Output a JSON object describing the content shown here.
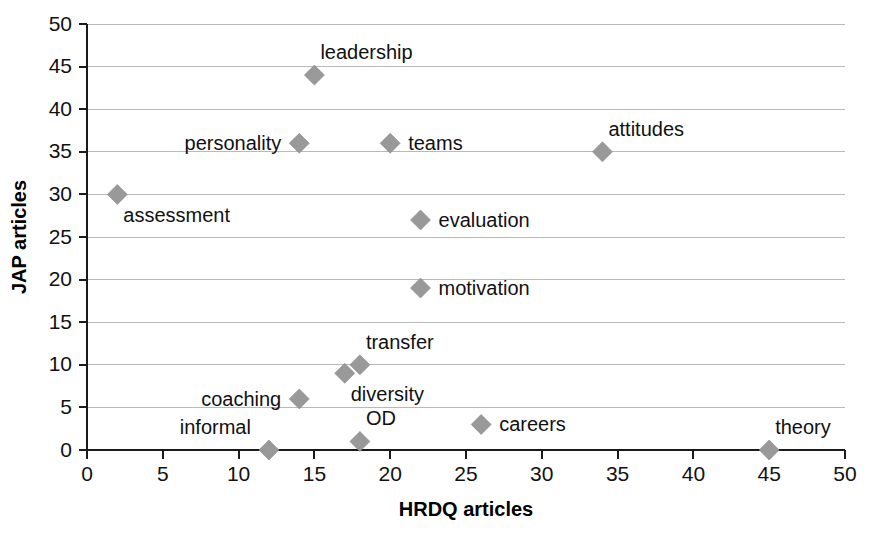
{
  "chart_data": {
    "type": "scatter",
    "title": "",
    "xlabel": "HRDQ articles",
    "ylabel": "JAP articles",
    "xlim": [
      0,
      50
    ],
    "ylim": [
      0,
      50
    ],
    "xticks": [
      0,
      5,
      10,
      15,
      20,
      25,
      30,
      35,
      40,
      45,
      50
    ],
    "yticks": [
      0,
      5,
      10,
      15,
      20,
      25,
      30,
      35,
      40,
      45,
      50
    ],
    "grid": "horizontal",
    "legend": "none",
    "marker": "diamond",
    "marker_color": "#999999",
    "gridline_color": "#b9b9b9",
    "axis_color": "#1a1a1a",
    "background_color": "#ffffff",
    "points": [
      {
        "label": "leadership",
        "x": 15,
        "y": 44,
        "label_pos": "above-right"
      },
      {
        "label": "personality",
        "x": 14,
        "y": 36,
        "label_pos": "left"
      },
      {
        "label": "teams",
        "x": 20,
        "y": 36,
        "label_pos": "right"
      },
      {
        "label": "attitudes",
        "x": 34,
        "y": 35,
        "label_pos": "above-right"
      },
      {
        "label": "assessment",
        "x": 2,
        "y": 30,
        "label_pos": "below-right"
      },
      {
        "label": "evaluation",
        "x": 22,
        "y": 27,
        "label_pos": "right"
      },
      {
        "label": "motivation",
        "x": 22,
        "y": 19,
        "label_pos": "right"
      },
      {
        "label": "transfer",
        "x": 18,
        "y": 10,
        "label_pos": "above-right"
      },
      {
        "label": "diversity",
        "x": 17,
        "y": 9,
        "label_pos": "below-right"
      },
      {
        "label": "coaching",
        "x": 14,
        "y": 6,
        "label_pos": "left"
      },
      {
        "label": "careers",
        "x": 26,
        "y": 3,
        "label_pos": "right"
      },
      {
        "label": "OD",
        "x": 18,
        "y": 1,
        "label_pos": "above-right"
      },
      {
        "label": "informal",
        "x": 12,
        "y": 0,
        "label_pos": "above-left"
      },
      {
        "label": "theory",
        "x": 45,
        "y": 0,
        "label_pos": "above-right"
      }
    ]
  }
}
